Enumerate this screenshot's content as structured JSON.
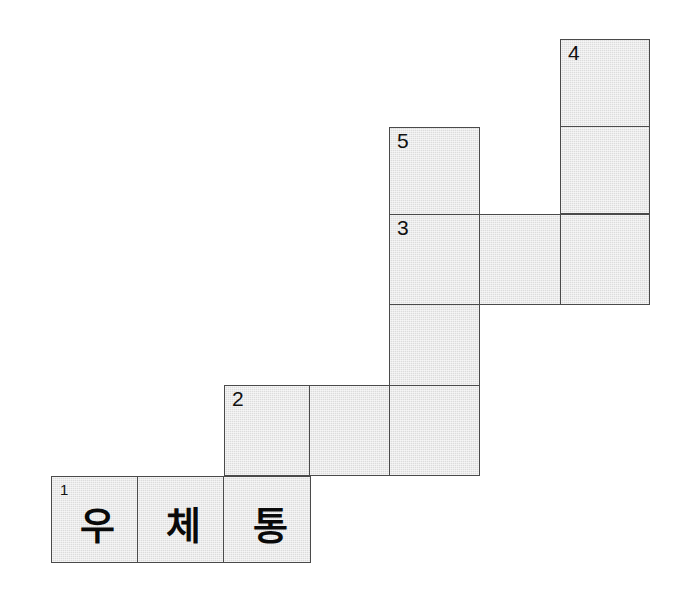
{
  "puzzle": {
    "type": "korean-crossword-grid",
    "canvas": {
      "width": 695,
      "height": 598,
      "background": "#ffffff"
    },
    "style": {
      "cell_fill": "#dcdcdc",
      "cell_border": "#4a4a4a",
      "text_color": "#0a0a0a"
    },
    "cell_size": {
      "width": 87,
      "height": 88
    },
    "cells": [
      {
        "id": "cell-r0c6",
        "x": 560,
        "y": 39,
        "w": 90,
        "h": 88,
        "number": "4",
        "letter": "",
        "number_style": "large"
      },
      {
        "id": "cell-r1c4",
        "x": 389,
        "y": 127,
        "w": 91,
        "h": 88,
        "number": "5",
        "letter": "",
        "number_style": "large"
      },
      {
        "id": "cell-r1c6",
        "x": 560,
        "y": 126,
        "w": 90,
        "h": 88,
        "number": "",
        "letter": "",
        "number_style": "large"
      },
      {
        "id": "cell-r2c4",
        "x": 389,
        "y": 214,
        "w": 91,
        "h": 91,
        "number": "3",
        "letter": "",
        "number_style": "large"
      },
      {
        "id": "cell-r2c5",
        "x": 479,
        "y": 214,
        "w": 82,
        "h": 91,
        "number": "",
        "letter": "",
        "number_style": "large"
      },
      {
        "id": "cell-r2c6",
        "x": 560,
        "y": 214,
        "w": 90,
        "h": 91,
        "number": "",
        "letter": "",
        "number_style": "large"
      },
      {
        "id": "cell-r3c4",
        "x": 389,
        "y": 304,
        "w": 91,
        "h": 82,
        "number": "",
        "letter": "",
        "number_style": "large"
      },
      {
        "id": "cell-r4c2",
        "x": 224,
        "y": 385,
        "w": 86,
        "h": 91,
        "number": "2",
        "letter": "",
        "number_style": "large"
      },
      {
        "id": "cell-r4c3",
        "x": 309,
        "y": 385,
        "w": 81,
        "h": 91,
        "number": "",
        "letter": "",
        "number_style": "large"
      },
      {
        "id": "cell-r4c4",
        "x": 389,
        "y": 385,
        "w": 91,
        "h": 91,
        "number": "",
        "letter": "",
        "number_style": "large"
      },
      {
        "id": "cell-r5c0",
        "x": 51,
        "y": 476,
        "w": 87,
        "h": 87,
        "number": "1",
        "letter": "우",
        "number_style": "small"
      },
      {
        "id": "cell-r5c1",
        "x": 137,
        "y": 476,
        "w": 87,
        "h": 87,
        "number": "",
        "letter": "체",
        "number_style": "large"
      },
      {
        "id": "cell-r5c2",
        "x": 223,
        "y": 476,
        "w": 88,
        "h": 87,
        "number": "",
        "letter": "통",
        "number_style": "large"
      }
    ],
    "clue_numbers": [
      "1",
      "2",
      "3",
      "4",
      "5"
    ],
    "filled_answer": "우체통"
  }
}
